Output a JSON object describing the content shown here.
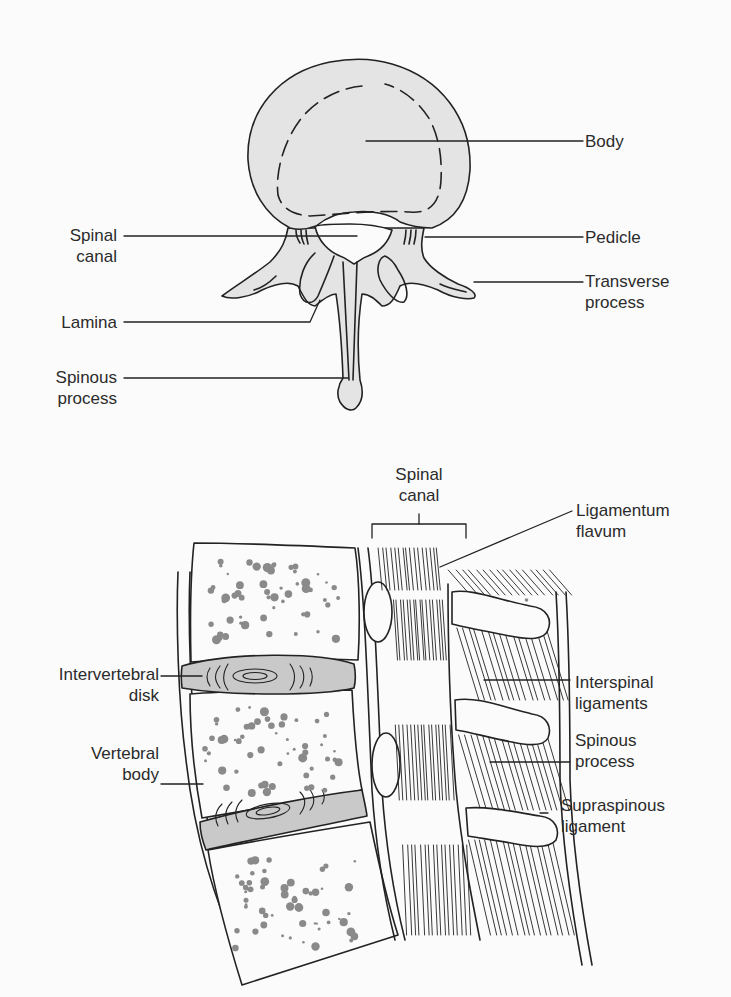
{
  "figure": {
    "top_view": {
      "labels": [
        {
          "id": "body",
          "lines": [
            "Body"
          ]
        },
        {
          "id": "spinal-canal",
          "lines": [
            "Spinal",
            "canal"
          ]
        },
        {
          "id": "pedicle",
          "lines": [
            "Pedicle"
          ]
        },
        {
          "id": "transverse-process",
          "lines": [
            "Transverse",
            "process"
          ]
        },
        {
          "id": "lamina",
          "lines": [
            "Lamina"
          ]
        },
        {
          "id": "spinous-process",
          "lines": [
            "Spinous",
            "process"
          ]
        }
      ]
    },
    "side_view": {
      "labels": [
        {
          "id": "spinal-canal",
          "lines": [
            "Spinal",
            "canal"
          ]
        },
        {
          "id": "ligamentum-flavum",
          "lines": [
            "Ligamentum",
            "flavum"
          ]
        },
        {
          "id": "intervertebral-disk",
          "lines": [
            "Intervertebral",
            "disk"
          ]
        },
        {
          "id": "interspinal-ligaments",
          "lines": [
            "Interspinal",
            "ligaments"
          ]
        },
        {
          "id": "spinous-process",
          "lines": [
            "Spinous",
            "process"
          ]
        },
        {
          "id": "vertebral-body",
          "lines": [
            "Vertebral",
            "body"
          ]
        },
        {
          "id": "supraspinous-ligament",
          "lines": [
            "Supraspinous",
            "ligament"
          ]
        }
      ]
    }
  },
  "colors": {
    "bone_fill": "#e4e4e4",
    "disk_fill": "#c9c9c9",
    "stroke": "#222222",
    "trabecula": "#8a8a8a",
    "text": "#2b2b2b"
  }
}
